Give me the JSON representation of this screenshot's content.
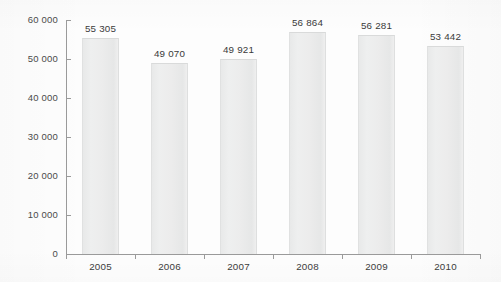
{
  "chart_data": {
    "type": "bar",
    "title": "",
    "subtitle": "",
    "xlabel": "",
    "ylabel": "",
    "categories": [
      "2005",
      "2006",
      "2007",
      "2008",
      "2009",
      "2010"
    ],
    "values": [
      55305,
      49070,
      49921,
      56864,
      56281,
      53442
    ],
    "value_labels": [
      "55 305",
      "49 070",
      "49 921",
      "56 864",
      "56 281",
      "53 442"
    ],
    "ylim": [
      0,
      60000
    ],
    "ytick_values": [
      0,
      10000,
      20000,
      30000,
      40000,
      50000,
      60000
    ],
    "ytick_labels": [
      "0",
      "10 000",
      "20 000",
      "30 000",
      "40 000",
      "50 000",
      "60 000"
    ],
    "grid": false,
    "legend": null,
    "legend_position": "none",
    "series": [
      {
        "name": "",
        "values": [
          55305,
          49070,
          49921,
          56864,
          56281,
          53442
        ]
      }
    ],
    "colors": {
      "bar_fill": "#ececec",
      "bar_edge": "#dedfdf",
      "axis": "#9a9a9a",
      "tick_text": "#4a4a4a",
      "label_text": "#3a3a3a",
      "background": "#fdfdfd"
    }
  }
}
